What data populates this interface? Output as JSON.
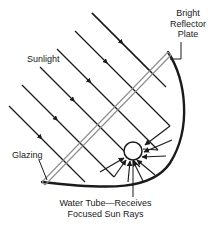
{
  "diagram": {
    "colors": {
      "ink": "#1a1a1a",
      "glazing_line": "#8c8c8c",
      "background": "#ffffff"
    },
    "labels": {
      "reflector": {
        "text": "Bright\nReflector\nPlate",
        "line1": "Bright",
        "line2": "Reflector",
        "line3": "Plate"
      },
      "sunlight": "Sunlight",
      "glazing": "Glazing",
      "water_tube": {
        "line1": "Water Tube—Receives",
        "line2": "Focused Sun Rays"
      }
    },
    "parts": [
      {
        "name": "bright-reflector-plate",
        "kind": "curved-mirror"
      },
      {
        "name": "glazing",
        "kind": "transparent-cover"
      },
      {
        "name": "water-tube",
        "kind": "absorber-pipe"
      },
      {
        "name": "sunlight-rays",
        "kind": "incoming-parallel-rays",
        "count": 6
      },
      {
        "name": "focused-rays",
        "kind": "reflected-converging-rays",
        "count": 8
      }
    ]
  }
}
